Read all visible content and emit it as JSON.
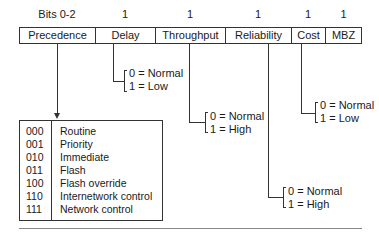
{
  "diagram": {
    "bits_labels": [
      "Bits 0-2",
      "1",
      "1",
      "1",
      "1",
      "1"
    ],
    "fields": [
      "Precedence",
      "Delay",
      "Throughput",
      "Reliability",
      "Cost",
      "MBZ"
    ],
    "delay_values": [
      "0 = Normal",
      "1 = Low"
    ],
    "throughput_values": [
      "0 = Normal",
      "1 = High"
    ],
    "reliability_values": [
      "0 = Normal",
      "1 = High"
    ],
    "cost_values": [
      "0 = Normal",
      "1 = Low"
    ],
    "precedence_table": [
      {
        "code": "000",
        "name": "Routine"
      },
      {
        "code": "001",
        "name": "Priority"
      },
      {
        "code": "010",
        "name": "Immediate"
      },
      {
        "code": "011",
        "name": "Flash"
      },
      {
        "code": "100",
        "name": "Flash override"
      },
      {
        "code": "110",
        "name": "Internetwork control"
      },
      {
        "code": "111",
        "name": "Network control"
      }
    ]
  }
}
